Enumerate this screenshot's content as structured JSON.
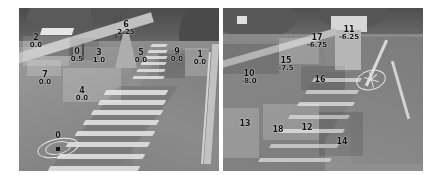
{
  "figure": {
    "type": "image-pair-with-annotations",
    "background_color": "#ffffff",
    "panel_count": 2,
    "scene_description": "grayscale outdoor photograph of an outdoor staircase and path"
  },
  "panels": [
    {
      "name": "left-panel",
      "annotations": [
        {
          "id": "2",
          "value": "0.0",
          "x": 17,
          "y": 26
        },
        {
          "id": "0",
          "value": "0.5",
          "x": 58,
          "y": 40
        },
        {
          "id": "6",
          "value": "2.25",
          "x": 107,
          "y": 13
        },
        {
          "id": "3",
          "value": "1.0",
          "x": 80,
          "y": 41
        },
        {
          "id": "5",
          "value": "0.0",
          "x": 122,
          "y": 41
        },
        {
          "id": "9",
          "value": "0.0",
          "x": 158,
          "y": 40
        },
        {
          "id": "1",
          "value": "0.0",
          "x": 181,
          "y": 43
        },
        {
          "id": "7",
          "value": "0.0",
          "x": 26,
          "y": 63
        },
        {
          "id": "4",
          "value": "0.0",
          "x": 63,
          "y": 79
        },
        {
          "id": "0",
          "value": "",
          "x": 39,
          "y": 124
        }
      ],
      "marker": {
        "name": "highlighted-point-marker",
        "x": 39,
        "y": 140
      }
    },
    {
      "name": "right-panel",
      "annotations": [
        {
          "id": "17",
          "value": "-6.75",
          "x": 94,
          "y": 26
        },
        {
          "id": "11",
          "value": "-6.25",
          "x": 126,
          "y": 18
        },
        {
          "id": "15",
          "value": "-7.5",
          "x": 63,
          "y": 49
        },
        {
          "id": "10",
          "value": "-8.0",
          "x": 26,
          "y": 62
        },
        {
          "id": "16",
          "value": "",
          "x": 97,
          "y": 68
        },
        {
          "id": "13",
          "value": "",
          "x": 22,
          "y": 112
        },
        {
          "id": "18",
          "value": "",
          "x": 55,
          "y": 118
        },
        {
          "id": "12",
          "value": "",
          "x": 84,
          "y": 116
        },
        {
          "id": "14",
          "value": "",
          "x": 119,
          "y": 130
        }
      ],
      "marker": {
        "name": "bicycle-roundel-road-marking",
        "x": 148,
        "y": 72
      }
    }
  ]
}
